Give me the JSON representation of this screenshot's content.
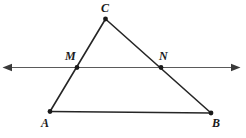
{
  "figure": {
    "background_color": "#ffffff",
    "stroke_color": "#262626",
    "transversal_color": "#5a5a5a",
    "width": 246,
    "height": 138
  },
  "labels": {
    "c": "C",
    "m": "M",
    "n": "N",
    "a": "A",
    "b": "B"
  },
  "points": {
    "C": {
      "x": 105.5,
      "y": 19.0
    },
    "A": {
      "x": 50.0,
      "y": 111.5
    },
    "B": {
      "x": 211.0,
      "y": 113.0
    },
    "M": {
      "x": 77.0,
      "y": 67.5
    },
    "N": {
      "x": 161.0,
      "y": 67.5
    }
  },
  "segments": [
    {
      "name": "side-CA",
      "from": "C",
      "to": "A"
    },
    {
      "name": "side-CB",
      "from": "C",
      "to": "B"
    },
    {
      "name": "side-AB",
      "from": "A",
      "to": "B"
    }
  ],
  "transversal": {
    "name": "line-MN",
    "y": 67.5,
    "x_start": 3,
    "x_end": 240,
    "arrow_left": true,
    "arrow_right": true
  }
}
